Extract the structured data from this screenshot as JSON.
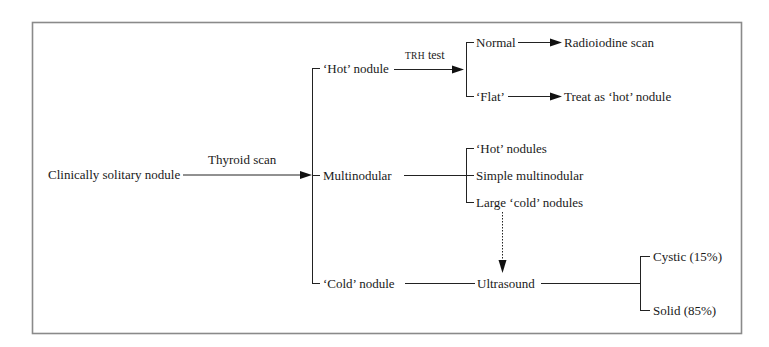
{
  "diagram": {
    "type": "flowchart",
    "colors": {
      "line": "#222222",
      "frame": "#8a8a8a",
      "text": "#1a1a1a",
      "background": "#ffffff"
    },
    "root": {
      "label": "Clinically solitary nodule"
    },
    "edges": {
      "thyroid_scan": "Thyroid scan",
      "trh_prefix": "TRH",
      "trh_suffix": " test"
    },
    "scan_results": {
      "hot": "‘Hot’ nodule",
      "multi": "Multinodular",
      "cold": "‘Cold’ nodule"
    },
    "trh_results": {
      "normal": "Normal",
      "flat": "‘Flat’"
    },
    "trh_outcomes": {
      "normal": "Radioiodine scan",
      "flat": "Treat as ‘hot’ nodule"
    },
    "multinodular_types": [
      "‘Hot’ nodules",
      "Simple multinodular",
      "Large ‘cold’ nodules"
    ],
    "cold_next": "Ultrasound",
    "ultrasound_results": {
      "cystic": "Cystic (15%)",
      "solid": "Solid (85%)"
    }
  }
}
